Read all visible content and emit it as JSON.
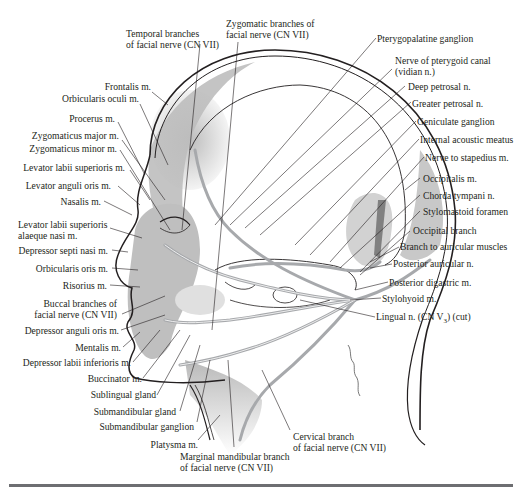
{
  "figure": {
    "rule_color": "#6d6e71",
    "shading_color": "#c8c8c8",
    "nerve_color": "#a7a9ac",
    "line_color": "#231f20"
  },
  "labels_top": [
    {
      "id": "temporal-branches",
      "lines": [
        "Temporal branches",
        "of facial nerve (CN VII)"
      ]
    },
    {
      "id": "zygomatic-branches",
      "lines": [
        "Zygomatic branches of",
        "facial nerve (CN VII)"
      ]
    }
  ],
  "labels_left": [
    {
      "id": "frontalis",
      "text": "Frontalis m."
    },
    {
      "id": "orbicularis-oculi",
      "text": "Orbicularis oculi m."
    },
    {
      "id": "procerus",
      "text": "Procerus m."
    },
    {
      "id": "zygomaticus-major",
      "text": "Zygomaticus major m."
    },
    {
      "id": "zygomaticus-minor",
      "text": "Zygomaticus minor m."
    },
    {
      "id": "levator-labii-superioris",
      "text": "Levator labii superioris m."
    },
    {
      "id": "levator-anguli-oris",
      "text": "Levator anguli oris m."
    },
    {
      "id": "nasalis",
      "text": "Nasalis m."
    },
    {
      "id": "levator-labii-sup-alaeque",
      "lines": [
        "Levator labii superioris",
        "alaeque nasi m."
      ]
    },
    {
      "id": "depressor-septi-nasi",
      "text": "Depressor septi nasi m."
    },
    {
      "id": "orbicularis-oris",
      "text": "Orbicularis oris m."
    },
    {
      "id": "risorius",
      "text": "Risorius m."
    },
    {
      "id": "buccal-branches",
      "lines": [
        "Buccal branches of",
        "facial nerve (CN VII)"
      ]
    },
    {
      "id": "depressor-anguli-oris",
      "text": "Depressor anguli oris m."
    },
    {
      "id": "mentalis",
      "text": "Mentalis m."
    },
    {
      "id": "depressor-labii-inferioris",
      "text": "Depressor labii inferioris m."
    }
  ],
  "labels_bottom": [
    {
      "id": "buccinator",
      "text": "Buccinator m."
    },
    {
      "id": "sublingual-gland",
      "text": "Sublingual gland"
    },
    {
      "id": "submandibular-gland",
      "text": "Submandibular gland"
    },
    {
      "id": "submandibular-ganglion",
      "text": "Submandibular ganglion"
    },
    {
      "id": "platysma",
      "text": "Platysma m."
    },
    {
      "id": "marginal-mandibular",
      "lines": [
        "Marginal mandibular branch",
        "of facial nerve (CN VII)"
      ]
    },
    {
      "id": "cervical-branch",
      "lines": [
        "Cervical branch",
        "of facial nerve (CN VII)"
      ]
    }
  ],
  "labels_right": [
    {
      "id": "pterygopalatine-ganglion",
      "text": "Pterygopalatine ganglion"
    },
    {
      "id": "nerve-pterygoid-canal",
      "lines": [
        "Nerve of pterygoid canal",
        "(vidian n.)"
      ]
    },
    {
      "id": "deep-petrosal",
      "text": "Deep petrosal n."
    },
    {
      "id": "greater-petrosal",
      "text": "Greater petrosal n."
    },
    {
      "id": "geniculate-ganglion",
      "text": "Geniculate ganglion"
    },
    {
      "id": "internal-acoustic-meatus",
      "text": "Internal acoustic meatus"
    },
    {
      "id": "nerve-to-stapedius",
      "text": "Nerve to stapedius m."
    },
    {
      "id": "occipitalis",
      "text": "Occipitalis m."
    },
    {
      "id": "chorda-tympani",
      "text": "Chorda tympani n."
    },
    {
      "id": "stylomastoid-foramen",
      "text": "Stylomastoid foramen"
    },
    {
      "id": "occipital-branch",
      "text": "Occipital branch"
    },
    {
      "id": "branch-auricular-muscles",
      "text": "Branch to auricular muscles"
    },
    {
      "id": "posterior-auricular",
      "text": "Posterior auricular n."
    },
    {
      "id": "posterior-digastric",
      "text": "Posterior digastric m."
    },
    {
      "id": "stylohyoid",
      "text": "Stylohyoid m."
    },
    {
      "id": "lingual-nerve",
      "text_main": "Lingual n. (CN V",
      "text_sub": "3",
      "text_tail": ") (cut)"
    }
  ]
}
